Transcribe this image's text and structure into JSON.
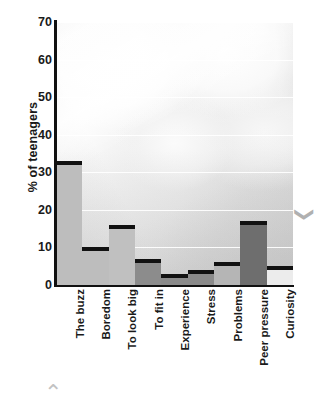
{
  "chart_data": {
    "type": "bar",
    "title": "",
    "subtitle": "",
    "xlabel": "",
    "ylabel": "% of teenagers",
    "ylim": [
      0,
      70
    ],
    "ytick_step": 10,
    "yticks": [
      0,
      10,
      20,
      30,
      40,
      50,
      60,
      70
    ],
    "grid": "horizontal-white",
    "legend": "none",
    "categories": [
      "The buzz",
      "Boredom",
      "To look big",
      "To fit in",
      "Experience",
      "Stress",
      "Problems",
      "Peer pressure",
      "Curiosity"
    ],
    "values": [
      33,
      10,
      16,
      7,
      3,
      4,
      6,
      17,
      5
    ],
    "bar_fill_colors": [
      "#bdbdbd",
      "#bdbdbd",
      "#c0c0c0",
      "#8c8c8c",
      "#8a8a8a",
      "#8a8a8a",
      "#b5b5b5",
      "#6e6e6e",
      "#ececec"
    ],
    "bar_top_color": "#111111",
    "background": "photograph-of-pills"
  },
  "decorations": {
    "chevron_right": "❯",
    "chevron_bottom": "⌃"
  }
}
